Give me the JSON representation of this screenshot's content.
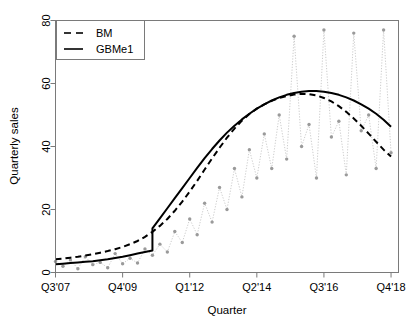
{
  "chart_data": {
    "type": "line",
    "title": "",
    "xlabel": "Quarter",
    "ylabel": "Quarterly sales",
    "xlim": [
      0,
      46
    ],
    "ylim": [
      0,
      80
    ],
    "yticks": [
      0,
      20,
      40,
      60,
      80
    ],
    "ytick_labels": [
      "0",
      "20",
      "40",
      "60",
      "80"
    ],
    "xticks": [
      0,
      9,
      18,
      27,
      36,
      45
    ],
    "xtick_labels": [
      "Q3'07",
      "Q4'09",
      "Q1'12",
      "Q2'14",
      "Q3'16",
      "Q4'18"
    ],
    "grid": false,
    "legend_position": "top-left",
    "legend": [
      {
        "name": "BM",
        "style": "dashed",
        "color": "#000000"
      },
      {
        "name": "GBMe1",
        "style": "solid",
        "color": "#000000"
      }
    ],
    "observed": {
      "name": "observed quarterly sales",
      "style": "dotted-with-points",
      "line_color": "#cccccc",
      "point_color": "#9a9a9a",
      "x": [
        0,
        1,
        2,
        3,
        4,
        5,
        6,
        7,
        8,
        9,
        10,
        11,
        12,
        13,
        14,
        15,
        16,
        17,
        18,
        19,
        20,
        21,
        22,
        23,
        24,
        25,
        26,
        27,
        28,
        29,
        30,
        31,
        32,
        33,
        34,
        35,
        36,
        37,
        38,
        39,
        40,
        41,
        42,
        43,
        44,
        45
      ],
      "y": [
        3.5,
        2.0,
        4.0,
        1.2,
        5.0,
        2.5,
        3.2,
        1.5,
        6.0,
        2.8,
        4.5,
        3.0,
        7.5,
        5.5,
        9.0,
        6.5,
        13.0,
        9.5,
        17.0,
        12.0,
        22.0,
        16.0,
        27.0,
        20.0,
        33.0,
        24.0,
        39.0,
        30.0,
        44.0,
        33.0,
        50.0,
        36.0,
        75.0,
        40.0,
        47.0,
        30.0,
        77.0,
        43.0,
        48.0,
        31.0,
        76.0,
        45.0,
        50.0,
        33.0,
        77.0,
        38.0
      ]
    },
    "series": [
      {
        "name": "BM",
        "style": "dashed",
        "color": "#000000",
        "x": [
          0,
          1,
          2,
          3,
          4,
          5,
          6,
          7,
          8,
          9,
          10,
          11,
          12,
          13,
          14,
          15,
          16,
          17,
          18,
          19,
          20,
          21,
          22,
          23,
          24,
          25,
          26,
          27,
          28,
          29,
          30,
          31,
          32,
          33,
          34,
          35,
          36,
          37,
          38,
          39,
          40,
          41,
          42,
          43,
          44,
          45
        ],
        "y": [
          4.2,
          4.4,
          4.7,
          5.0,
          5.4,
          5.8,
          6.3,
          6.8,
          7.4,
          8.1,
          9.0,
          10.0,
          11.3,
          12.9,
          14.8,
          17.0,
          19.6,
          22.5,
          25.7,
          29.1,
          32.7,
          36.2,
          39.6,
          42.8,
          45.7,
          48.2,
          50.3,
          52.0,
          53.4,
          54.5,
          55.4,
          56.0,
          56.5,
          56.7,
          56.6,
          56.2,
          55.4,
          54.3,
          52.8,
          51.0,
          48.9,
          46.6,
          44.1,
          41.5,
          39.0,
          36.8
        ]
      },
      {
        "name": "GBMe1",
        "style": "solid",
        "color": "#000000",
        "jump_at_x": 13,
        "jump_from_y": 7.0,
        "jump_to_y": 14.0,
        "x": [
          0,
          1,
          2,
          3,
          4,
          5,
          6,
          7,
          8,
          9,
          10,
          11,
          12,
          13,
          13,
          14,
          15,
          16,
          17,
          18,
          19,
          20,
          21,
          22,
          23,
          24,
          25,
          26,
          27,
          28,
          29,
          30,
          31,
          32,
          33,
          34,
          35,
          36,
          37,
          38,
          39,
          40,
          41,
          42,
          43,
          44,
          45
        ],
        "y": [
          2.6,
          2.8,
          3.0,
          3.2,
          3.4,
          3.6,
          3.9,
          4.2,
          4.6,
          5.0,
          5.5,
          6.0,
          6.5,
          7.0,
          14.0,
          17.2,
          20.4,
          23.6,
          26.8,
          30.0,
          33.2,
          36.3,
          39.2,
          41.9,
          44.4,
          46.6,
          48.6,
          50.4,
          52.0,
          53.4,
          54.6,
          55.6,
          56.4,
          57.0,
          57.4,
          57.6,
          57.6,
          57.4,
          57.0,
          56.4,
          55.6,
          54.6,
          53.4,
          52.0,
          50.4,
          48.5,
          46.3
        ]
      }
    ]
  }
}
